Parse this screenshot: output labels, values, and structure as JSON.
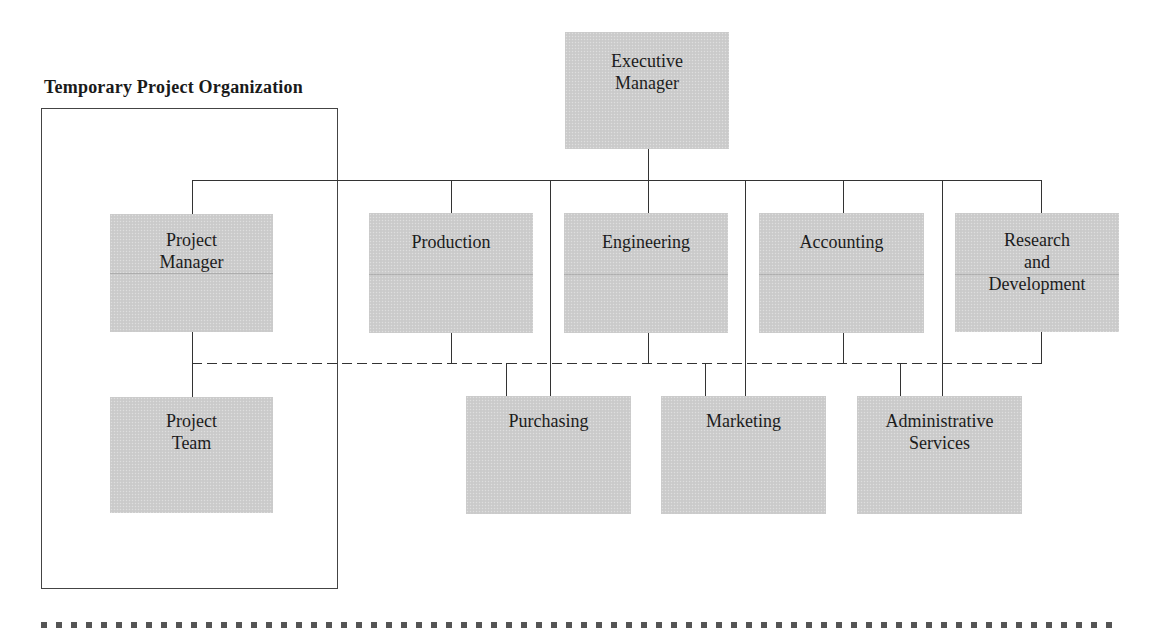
{
  "diagram": {
    "type": "organization-chart",
    "section_title": "Temporary Project Organization",
    "colors": {
      "node_fill": "#cdcdcd",
      "line": "#333333",
      "frame": "#444444",
      "rule": "#555555"
    },
    "nodes": {
      "executive_manager": "Executive\nManager",
      "project_manager": "Project\nManager",
      "production": "Production",
      "engineering": "Engineering",
      "accounting": "Accounting",
      "research_development": "Research\nand\nDevelopment",
      "project_team": "Project\nTeam",
      "purchasing": "Purchasing",
      "marketing": "Marketing",
      "administrative_services": "Administrative\nServices"
    },
    "relationships": {
      "solid_reporting": [
        [
          "Executive Manager",
          "Project Manager"
        ],
        [
          "Executive Manager",
          "Production"
        ],
        [
          "Executive Manager",
          "Engineering"
        ],
        [
          "Executive Manager",
          "Accounting"
        ],
        [
          "Executive Manager",
          "Research and Development"
        ],
        [
          "Executive Manager",
          "Purchasing"
        ],
        [
          "Executive Manager",
          "Marketing"
        ],
        [
          "Executive Manager",
          "Administrative Services"
        ],
        [
          "Project Manager",
          "Project Team"
        ]
      ],
      "dashed_project_links": [
        "Project Manager",
        "Production",
        "Engineering",
        "Accounting",
        "Research and Development",
        "Purchasing",
        "Marketing",
        "Administrative Services"
      ]
    }
  }
}
